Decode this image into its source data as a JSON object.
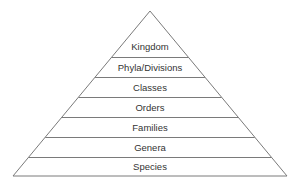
{
  "diagram": {
    "type": "pyramid",
    "levels": [
      {
        "label": "Kingdom"
      },
      {
        "label": "Phyla/Divisions"
      },
      {
        "label": "Classes"
      },
      {
        "label": "Orders"
      },
      {
        "label": "Families"
      },
      {
        "label": "Genera"
      },
      {
        "label": "Species"
      }
    ],
    "colors": {
      "line": "#7a7a7a",
      "text": "#333333",
      "background": "#ffffff"
    }
  }
}
